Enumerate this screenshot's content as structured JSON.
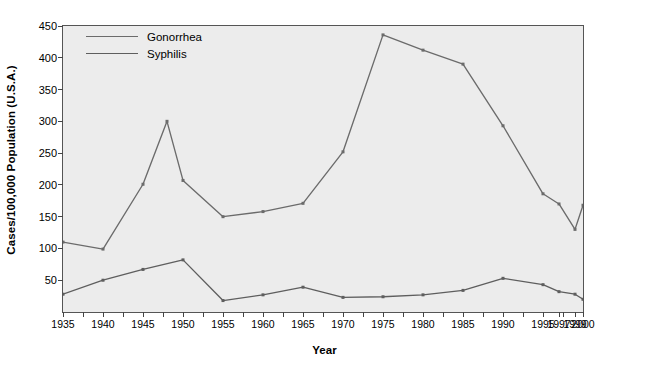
{
  "chart_data": {
    "type": "line",
    "title": "",
    "xlabel": "Year",
    "ylabel": "Cases/100,000 Population (U.S.A.)",
    "xlim": [
      1935,
      2000
    ],
    "ylim": [
      0,
      450
    ],
    "ytick_values": [
      50,
      100,
      150,
      200,
      250,
      300,
      350,
      400,
      450
    ],
    "ytick_labels": [
      "50",
      "100",
      "150",
      "200",
      "250",
      "300",
      "350",
      "400",
      "450"
    ],
    "xtick_values": [
      1935,
      1940,
      1945,
      1950,
      1955,
      1960,
      1965,
      1970,
      1975,
      1980,
      1985,
      1990,
      1995,
      1997,
      1999,
      2000
    ],
    "xtick_labels": [
      "1935",
      "1940",
      "1945",
      "1950",
      "1955",
      "1960",
      "1965",
      "1970",
      "1975",
      "1980",
      "1985",
      "1990",
      "1995",
      "1997",
      "1999",
      "2000"
    ],
    "grid": false,
    "legend_position": "upper-left",
    "series": [
      {
        "name": "Gonorrhea",
        "color": "#6b6b6b",
        "x": [
          1935,
          1940,
          1945,
          1948,
          1950,
          1955,
          1960,
          1965,
          1970,
          1975,
          1980,
          1985,
          1990,
          1995,
          1997,
          1999,
          2000
        ],
        "values": [
          110,
          99,
          201,
          300,
          207,
          150,
          158,
          171,
          252,
          436,
          412,
          390,
          293,
          186,
          170,
          130,
          168
        ]
      },
      {
        "name": "Syphilis",
        "color": "#5e5e5e",
        "x": [
          1935,
          1940,
          1945,
          1950,
          1955,
          1960,
          1965,
          1970,
          1975,
          1980,
          1985,
          1990,
          1995,
          1997,
          1999,
          2000
        ],
        "values": [
          28,
          50,
          67,
          82,
          18,
          27,
          39,
          23,
          24,
          27,
          34,
          53,
          43,
          32,
          28,
          20
        ]
      }
    ]
  },
  "legend": {
    "items": [
      {
        "label": "Gonorrhea"
      },
      {
        "label": "Syphilis"
      }
    ]
  },
  "axes": {
    "y_title": "Cases/100,000 Population (U.S.A.)",
    "x_title": "Year"
  }
}
